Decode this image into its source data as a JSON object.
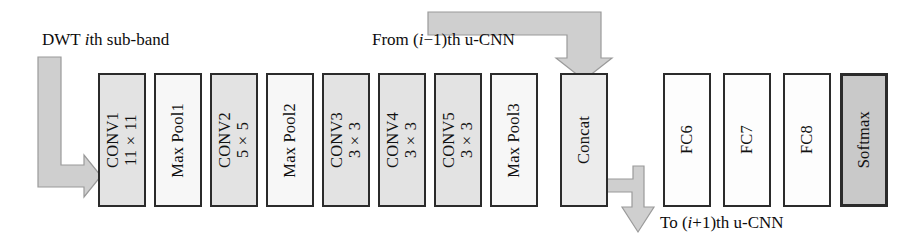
{
  "diagram": {
    "background_color": "#ffffff",
    "arrow_color": "#cccccc",
    "arrow_stroke": "#8c8c8c",
    "border_color": "#2b2b2b"
  },
  "captions": {
    "input": {
      "pre": "DWT ",
      "em": "i",
      "post": "th sub-band"
    },
    "from_prev": {
      "pre": "From (",
      "em": "i",
      "post": "−1)th u-CNN"
    },
    "to_next": {
      "pre": "To (",
      "em": "i",
      "post": "+1)th u-CNN"
    }
  },
  "layers": [
    {
      "name": "conv1",
      "kind": "conv",
      "line1": "CONV1",
      "line2": "11×11",
      "x": 98,
      "w": 48,
      "fill": "#e3e3e3"
    },
    {
      "name": "maxpool1",
      "kind": "pool",
      "line1": "Max Pool1",
      "line2": "",
      "x": 154,
      "w": 48,
      "fill": "#f7f7f7"
    },
    {
      "name": "conv2",
      "kind": "conv",
      "line1": "CONV2",
      "line2": "5×5",
      "x": 210,
      "w": 48,
      "fill": "#e3e3e3"
    },
    {
      "name": "maxpool2",
      "kind": "pool",
      "line1": "Max Pool2",
      "line2": "",
      "x": 266,
      "w": 48,
      "fill": "#f7f7f7"
    },
    {
      "name": "conv3",
      "kind": "conv",
      "line1": "CONV3",
      "line2": "3×3",
      "x": 322,
      "w": 48,
      "fill": "#e3e3e3"
    },
    {
      "name": "conv4",
      "kind": "conv",
      "line1": "CONV4",
      "line2": "3×3",
      "x": 378,
      "w": 48,
      "fill": "#e3e3e3"
    },
    {
      "name": "conv5",
      "kind": "conv",
      "line1": "CONV5",
      "line2": "3×3",
      "x": 434,
      "w": 48,
      "fill": "#e3e3e3"
    },
    {
      "name": "maxpool3",
      "kind": "pool",
      "line1": "Max Pool3",
      "line2": "",
      "x": 490,
      "w": 48,
      "fill": "#f7f7f7"
    },
    {
      "name": "concat",
      "kind": "concat",
      "line1": "Concat",
      "line2": "",
      "x": 560,
      "w": 48,
      "fill": "#ececec"
    },
    {
      "name": "fc6",
      "kind": "fc",
      "line1": "FC6",
      "line2": "",
      "x": 663,
      "w": 48,
      "fill": "#fdfdfd"
    },
    {
      "name": "fc7",
      "kind": "fc",
      "line1": "FC7",
      "line2": "",
      "x": 723,
      "w": 48,
      "fill": "#fdfdfd"
    },
    {
      "name": "fc8",
      "kind": "fc",
      "line1": "FC8",
      "line2": "",
      "x": 783,
      "w": 48,
      "fill": "#fdfdfd"
    },
    {
      "name": "softmax",
      "kind": "softmax",
      "line1": "Softmax",
      "line2": "",
      "x": 840,
      "w": 48,
      "fill": "#c9c9c9"
    }
  ],
  "arrows": [
    {
      "name": "input-arrow",
      "desc": "L-shaped arrow from DWT caption down and right into CONV1"
    },
    {
      "name": "from-prev-arrow",
      "desc": "Elbow arrow from left, turning down into Concat top"
    },
    {
      "name": "to-next-arrow",
      "desc": "Z-shaped arrow leaving Concat right side, turning down"
    }
  ]
}
